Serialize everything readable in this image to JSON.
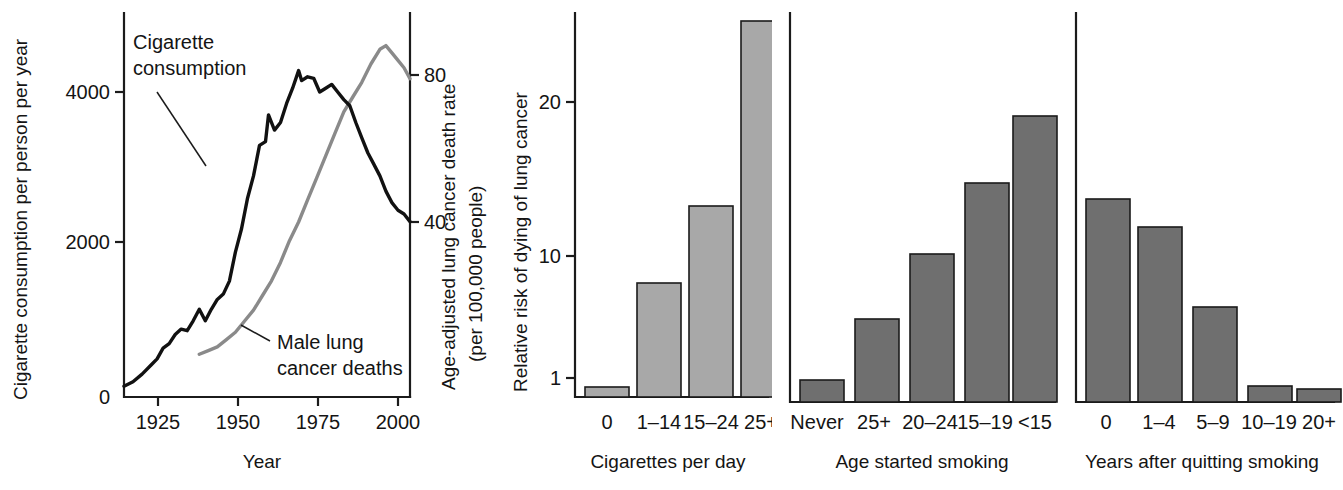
{
  "chart_data": [
    {
      "id": "timeline",
      "type": "line",
      "title": "",
      "xlabel": "Year",
      "ylabel_left": "Cigarette consumption per person per year",
      "ylabel_right_line1": "Age-adjusted lung cancer death rate",
      "ylabel_right_line2": "(per 100,000 people)",
      "xlim": [
        1905,
        2000
      ],
      "xticks": [
        1925,
        1950,
        1975,
        2000
      ],
      "xticklabels": [
        "1925",
        "1950",
        "1975",
        "2000"
      ],
      "ylim_left": [
        0,
        5000
      ],
      "yticks_left": [
        0,
        2000,
        4000
      ],
      "yticklabels_left": [
        "0",
        "2000",
        "4000"
      ],
      "ylim_right": [
        0,
        100
      ],
      "yticks_right": [
        40,
        80
      ],
      "yticklabels_right": [
        "40",
        "80"
      ],
      "grid": false,
      "annotations": [
        {
          "text_line1": "Cigarette",
          "text_line2": "consumption"
        },
        {
          "text_line1": "Male lung",
          "text_line2": "cancer deaths"
        }
      ],
      "series": [
        {
          "name": "Cigarette consumption",
          "axis": "left",
          "color": "#111111",
          "x": [
            1905,
            1908,
            1911,
            1914,
            1916,
            1918,
            1920,
            1922,
            1924,
            1926,
            1928,
            1930,
            1932,
            1934,
            1936,
            1938,
            1940,
            1942,
            1944,
            1946,
            1948,
            1950,
            1952,
            1953,
            1955,
            1957,
            1959,
            1961,
            1963,
            1964,
            1966,
            1968,
            1970,
            1972,
            1974,
            1976,
            1978,
            1980,
            1982,
            1984,
            1986,
            1988,
            1990,
            1992,
            1994,
            1996,
            1998,
            2000
          ],
          "y": [
            140,
            200,
            300,
            420,
            500,
            640,
            700,
            820,
            890,
            870,
            1000,
            1150,
            1000,
            1150,
            1280,
            1350,
            1520,
            1900,
            2200,
            2600,
            2900,
            3300,
            3350,
            3700,
            3500,
            3600,
            3850,
            4050,
            4280,
            4150,
            4200,
            4180,
            4000,
            4050,
            4100,
            4000,
            3900,
            3820,
            3600,
            3400,
            3200,
            3050,
            2900,
            2700,
            2550,
            2450,
            2400,
            2300
          ]
        },
        {
          "name": "Male lung cancer deaths",
          "axis": "right",
          "color": "#8a8a8a",
          "x": [
            1930,
            1933,
            1936,
            1939,
            1942,
            1945,
            1948,
            1951,
            1954,
            1957,
            1960,
            1963,
            1966,
            1969,
            1972,
            1975,
            1978,
            1981,
            1984,
            1987,
            1990,
            1992,
            1994,
            1996,
            1998,
            2000
          ],
          "y": [
            4,
            5,
            6,
            8,
            10,
            13,
            16,
            20,
            24,
            29,
            35,
            40,
            46,
            52,
            58,
            64,
            70,
            74,
            78,
            83,
            87,
            88,
            86,
            84,
            82,
            79
          ]
        }
      ]
    },
    {
      "id": "cigarettes-per-day",
      "type": "bar",
      "title": "",
      "xlabel": "Cigarettes per day",
      "ylabel": "Relative risk of dying of lung cancer",
      "yticks": [
        1,
        10,
        20
      ],
      "yticklabels": [
        "1",
        "10",
        "20"
      ],
      "grid": false,
      "bar_color": "#a8a8a8",
      "categories": [
        "0",
        "1–14",
        "15–24",
        "25+"
      ],
      "values": [
        1,
        8,
        14,
        27
      ]
    },
    {
      "id": "age-started-smoking",
      "type": "bar",
      "title": "",
      "xlabel": "Age started smoking",
      "ylabel": "",
      "grid": false,
      "bar_color": "#6f6f6f",
      "categories": [
        "Never",
        "25+",
        "20–24",
        "15–19",
        "<15"
      ],
      "values": [
        1,
        4,
        10,
        15,
        19
      ]
    },
    {
      "id": "years-after-quitting",
      "type": "bar",
      "title": "",
      "xlabel": "Years after quitting smoking",
      "ylabel": "",
      "grid": false,
      "bar_color": "#6f6f6f",
      "categories": [
        "0",
        "1–4",
        "5–9",
        "10–19",
        "20+"
      ],
      "values": [
        16,
        14,
        7,
        1.2,
        1
      ]
    }
  ]
}
